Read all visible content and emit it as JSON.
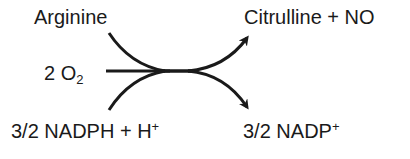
{
  "diagram": {
    "reactants": {
      "top": {
        "text": "Arginine"
      },
      "middle": {
        "coefficient": "2 O",
        "subscript": "2"
      },
      "bottom": {
        "text": "3/2 NADPH + H",
        "superscript": "+"
      }
    },
    "products": {
      "top": {
        "text": "Citrulline + NO"
      },
      "bottom": {
        "text": "3/2 NADP",
        "superscript": "+"
      }
    },
    "colors": {
      "ink": "#1a1a1a",
      "background": "#ffffff"
    }
  }
}
